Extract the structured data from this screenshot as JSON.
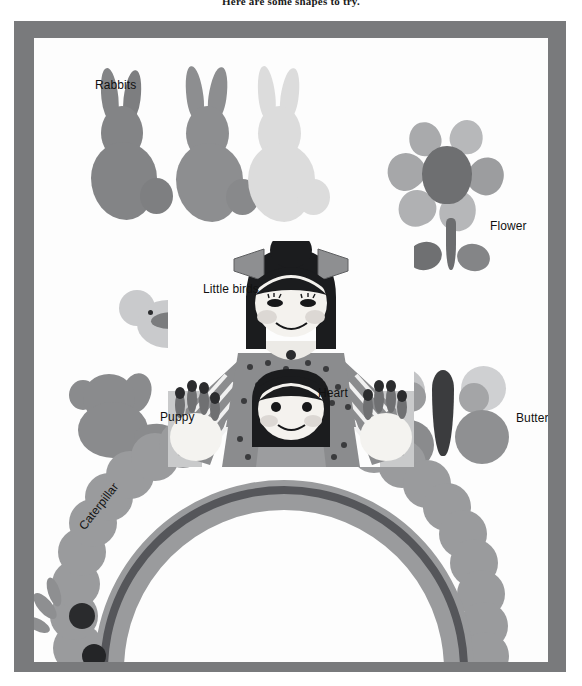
{
  "page": {
    "caption": "Here are some shapes to try.",
    "frame_color": "#797a7c",
    "paper_color": "#fdfdfd"
  },
  "labels": [
    {
      "id": "rabbits",
      "text": "Rabbits",
      "x": 75,
      "y": 60,
      "rotated": false
    },
    {
      "id": "flower",
      "text": "Flower",
      "x": 470,
      "y": 201,
      "rotated": false
    },
    {
      "id": "little-birds",
      "text": "Little birds",
      "x": 183,
      "y": 264,
      "rotated": false
    },
    {
      "id": "puppy",
      "text": "Puppy",
      "x": 140,
      "y": 392,
      "rotated": false
    },
    {
      "id": "heart",
      "text": "Heart",
      "x": 298,
      "y": 368,
      "rotated": false
    },
    {
      "id": "butterfly",
      "text": "Butterfly",
      "x": 496,
      "y": 393,
      "rotated": false
    },
    {
      "id": "caterpillar",
      "text": "Caterpillar",
      "x": 56,
      "y": 506,
      "rotated": true
    }
  ],
  "shapes": {
    "rabbits": {
      "name": "Rabbits",
      "count": 3,
      "colors": [
        "#838486",
        "#8d8e90",
        "#dcdcdc"
      ],
      "technique": "potato print"
    },
    "flower": {
      "name": "Flower",
      "petal_count": 6,
      "center_color": "#6e6f71",
      "petal_color": "#a9aaac",
      "stem_color": "#6c6d6f"
    },
    "little_birds": {
      "name": "Little birds",
      "count": 2,
      "colors": [
        "#c9cacc",
        "#6f7072"
      ]
    },
    "puppy": {
      "name": "Puppy",
      "color": "#8a8b8d"
    },
    "heart": {
      "name": "Heart",
      "color": "#b4b5b7"
    },
    "butterfly": {
      "name": "Butterfly",
      "wing_colors": [
        "#c3c4c6",
        "#9a9b9d",
        "#8a8b8d"
      ],
      "body_color": "#3b3c3e"
    },
    "caterpillar": {
      "name": "Caterpillar",
      "body_color": "#9a9b9d",
      "arc_color": "#77787a",
      "eye_color": "#2a2b2d"
    }
  },
  "photo": {
    "description": "Two children with printed patterned clothing and painted hands",
    "skin_color": "#f2f0ec",
    "hair_color": "#1b1c1e",
    "bow_color": "#8e8f91",
    "shirt_color": "#8b8c8e",
    "stripe_color": "#6f7072"
  }
}
